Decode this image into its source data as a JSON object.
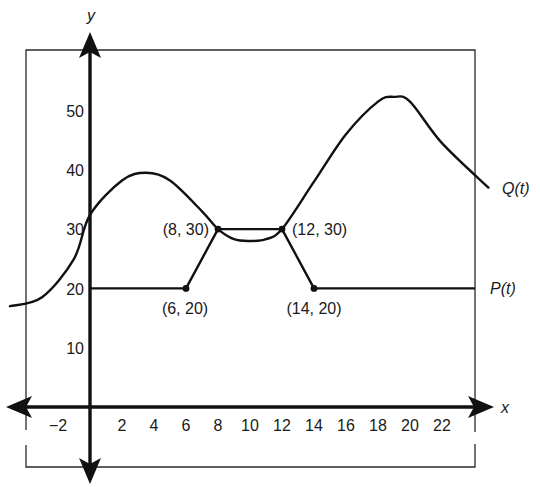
{
  "chart_data": {
    "type": "line",
    "title": "",
    "xlabel": "x",
    "ylabel": "y",
    "xlim": [
      -3,
      24.5
    ],
    "ylim": [
      -4,
      60
    ],
    "grid": false,
    "x_ticks": [
      -2,
      2,
      4,
      6,
      8,
      10,
      12,
      14,
      16,
      18,
      20,
      22
    ],
    "x_tick_labels": [
      "−2",
      "2",
      "4",
      "6",
      "8",
      "10",
      "12",
      "14",
      "16",
      "18",
      "20",
      "22"
    ],
    "y_ticks": [
      10,
      20,
      30,
      40,
      50
    ],
    "y_tick_labels": [
      "10",
      "20",
      "30",
      "40",
      "50"
    ],
    "series": [
      {
        "name": "P(t)",
        "label": "P(t)",
        "kind": "piecewise-linear",
        "x": [
          0,
          6,
          8,
          12,
          14,
          24
        ],
        "y": [
          20,
          20,
          30,
          30,
          20,
          20
        ]
      },
      {
        "name": "Q(t)",
        "label": "Q(t)",
        "kind": "smooth-curve",
        "x": [
          -5,
          -3,
          -1,
          0,
          2,
          3.5,
          5,
          7,
          8,
          9,
          10,
          11,
          12,
          14,
          16,
          18,
          19,
          20,
          22,
          24.9
        ],
        "y": [
          17,
          18.5,
          25,
          32.4,
          38.2,
          39.5,
          38.2,
          33,
          30,
          28.3,
          28,
          28.3,
          30,
          38,
          46,
          51.5,
          52.3,
          51.5,
          44.5,
          37
        ]
      }
    ],
    "annotations": [
      {
        "text": "(6, 20)",
        "x": 6,
        "y": 20,
        "marker": true
      },
      {
        "text": "(8, 30)",
        "x": 8,
        "y": 30,
        "marker": true
      },
      {
        "text": "(12, 30)",
        "x": 12,
        "y": 30,
        "marker": true
      },
      {
        "text": "(14, 20)",
        "x": 14,
        "y": 20,
        "marker": true
      }
    ],
    "legend": {
      "position": "inline-right",
      "entries": [
        "Q(t)",
        "P(t)"
      ]
    }
  },
  "labels": {
    "x_axis": "x",
    "y_axis": "y",
    "q_label": "Q(t)",
    "p_label": "P(t)",
    "pt_6_20": "(6, 20)",
    "pt_8_30": "(8, 30)",
    "pt_12_30": "(12, 30)",
    "pt_14_20": "(14, 20)",
    "xt": [
      "−2",
      "2",
      "4",
      "6",
      "8",
      "10",
      "12",
      "14",
      "16",
      "18",
      "20",
      "22"
    ],
    "yt": [
      "10",
      "20",
      "30",
      "40",
      "50"
    ]
  }
}
